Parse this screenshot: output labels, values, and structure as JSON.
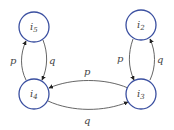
{
  "diagram": {
    "type": "state-transition",
    "colors": {
      "node_stroke": "#3a4fa0",
      "edge": "#555555",
      "label": "#444444",
      "background": "#ffffff"
    },
    "nodes": [
      {
        "id": "i5",
        "base": "i",
        "sub": "5",
        "cx": 34,
        "cy": 27
      },
      {
        "id": "i2",
        "base": "i",
        "sub": "2",
        "cx": 141,
        "cy": 25
      },
      {
        "id": "i4",
        "base": "i",
        "sub": "4",
        "cx": 34,
        "cy": 94
      },
      {
        "id": "i3",
        "base": "i",
        "sub": "3",
        "cx": 141,
        "cy": 94
      }
    ],
    "edges": [
      {
        "from": "i4",
        "to": "i5",
        "label": "p"
      },
      {
        "from": "i5",
        "to": "i4",
        "label": "q"
      },
      {
        "from": "i2",
        "to": "i3",
        "label": "p"
      },
      {
        "from": "i3",
        "to": "i2",
        "label": "q"
      },
      {
        "from": "i3",
        "to": "i4",
        "label": "p"
      },
      {
        "from": "i4",
        "to": "i3",
        "label": "q"
      }
    ]
  }
}
